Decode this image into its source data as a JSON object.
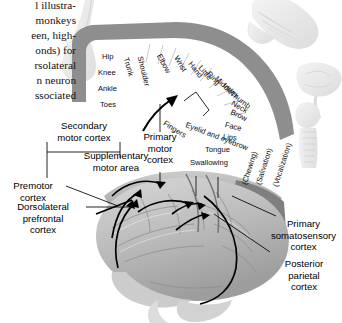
{
  "figure": {
    "type": "anatomical-diagram"
  },
  "body_text": {
    "lines": [
      "l illustra-",
      "monkeys",
      "een, high-",
      "onds) for",
      "rsolateral",
      "n neuron",
      "ssociated"
    ],
    "full": "l illustra- monkeys een, high- onds) for rsolateral n neuron ssociated"
  },
  "callouts": {
    "secondary_motor_cortex": "Secondary\nmotor cortex",
    "secondary_motor_cortex_l1": "Secondary",
    "secondary_motor_cortex_l2": "motor cortex",
    "supplementary_motor_area_l1": "Supplementary",
    "supplementary_motor_area_l2": "motor area",
    "premotor_cortex_l1": "Premotor",
    "premotor_cortex_l2": "cortex",
    "dorsolateral_prefrontal_l1": "Dorsolateral",
    "dorsolateral_prefrontal_l2": "prefrontal",
    "dorsolateral_prefrontal_l3": "cortex",
    "primary_motor_cortex_l1": "Primary",
    "primary_motor_cortex_l2": "motor",
    "primary_motor_cortex_l3": "cortex",
    "primary_somatosensory_l1": "Primary",
    "primary_somatosensory_l2": "somatosensory",
    "primary_somatosensory_l3": "cortex",
    "posterior_parietal_l1": "Posterior",
    "posterior_parietal_l2": "parietal",
    "posterior_parietal_l3": "cortex"
  },
  "homunculus": {
    "medial_labels": [
      "Hip",
      "Knee",
      "Ankle",
      "Toes"
    ],
    "rotated_labels": [
      "Trunk",
      "Shoulder",
      "Elbow",
      "Wrist",
      "Hand",
      "Little",
      "Ring",
      "Middle",
      "Index",
      "Thumb",
      "Neck",
      "Brow",
      "Eyelid and eyebrow",
      "Face",
      "Lips"
    ],
    "lower_labels": [
      "Tongue",
      "Swallowing"
    ],
    "bracket_label": "Fingers",
    "vertical_labels": [
      "(Chewing)",
      "(Salivation)",
      "(Vocalization)"
    ]
  },
  "colors": {
    "cortex_band": "#8e8e8e",
    "brain_mid": "#b9b9b9",
    "brain_dark": "#7d7d7d",
    "ghost": "#e9e9e9",
    "ink": "#000000"
  }
}
